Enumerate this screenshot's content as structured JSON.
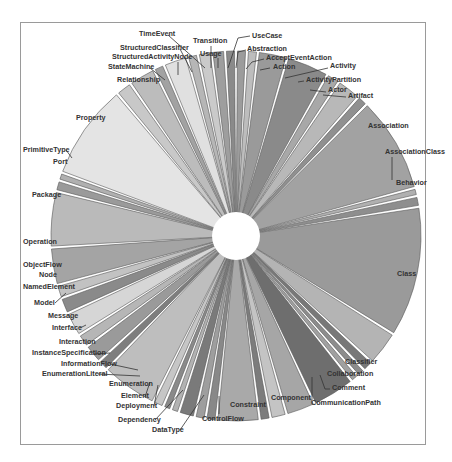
{
  "chart_data": {
    "type": "pie",
    "subtype": "exploded-pie",
    "title": "",
    "legend": "none (leader-line labels)",
    "start_angle_deg": 0,
    "direction": "clockwise",
    "center": [
      236,
      236
    ],
    "radius": 185,
    "inner_gap_radius": 22,
    "categories": [
      "Abstraction",
      "AcceptEventAction",
      "Action",
      "Activity",
      "ActivityPartition",
      "Actor",
      "Artifact",
      "Association",
      "AssociationClass",
      "Behavior",
      "Class",
      "Classifier",
      "Collaboration",
      "Comment",
      "CommunicationPath",
      "Component",
      "Constraint",
      "ControlFlow",
      "DataType",
      "Dependency",
      "Deployment",
      "Element",
      "Enumeration",
      "EnumerationLiteral",
      "InformationFlow",
      "InstanceSpecification",
      "Interaction",
      "Interface",
      "Message",
      "Model",
      "NamedElement",
      "Node",
      "ObjectFlow",
      "Operation",
      "Package",
      "Port",
      "PrimitiveType",
      "Property",
      "Relationship",
      "StateMachine",
      "StructuredActivityNode",
      "StructuredClassifier",
      "TimeEvent",
      "Transition",
      "Usage",
      "UseCase"
    ],
    "values": [
      3,
      3,
      10,
      15,
      4,
      8,
      3,
      35,
      2,
      3,
      48,
      12,
      3,
      2,
      2,
      15,
      10,
      5,
      3,
      15,
      3,
      3,
      5,
      2,
      2,
      3,
      20,
      3,
      6,
      4,
      8,
      5,
      4,
      13,
      20,
      3,
      2,
      35,
      5,
      9,
      3,
      8,
      3,
      4,
      4,
      3
    ],
    "shades": [
      "#9c9c9c",
      "#bdbdbd",
      "#9a9a9a",
      "#8a8a8a",
      "#a8a8a8",
      "#b8b8b8",
      "#909090",
      "#a2a2a2",
      "#b0b0b0",
      "#8e8e8e",
      "#9a9a9a",
      "#b4b4b4",
      "#787878",
      "#8c8c8c",
      "#a0a0a0",
      "#6e6e6e",
      "#a6a6a6",
      "#c4c4c4",
      "#7c7c7c",
      "#a9a9a9",
      "#888888",
      "#9e9e9e",
      "#7a7a7a",
      "#b2b2b2",
      "#8a8a8a",
      "#c6c6c6",
      "#bebebe",
      "#7e7e7e",
      "#9a9a9a",
      "#b6b6b6",
      "#d6d6d6",
      "#8a8a8a",
      "#c2c2c2",
      "#a4a4a4",
      "#bababa",
      "#9a9a9a",
      "#b0b0b0",
      "#e4e4e4",
      "#c8c8c8",
      "#bcbcbc",
      "#a2a2a2",
      "#e0e0e0",
      "#b6b6b6",
      "#cacaca",
      "#9e9e9e",
      "#8a8a8a"
    ],
    "labels": [
      {
        "text": "UseCase",
        "x": 252,
        "y": 38,
        "anchor": "start",
        "lx": [
          250,
          238,
          228
        ],
        "ly": [
          36,
          38,
          68
        ]
      },
      {
        "text": "Abstraction",
        "x": 247,
        "y": 51,
        "anchor": "start",
        "lx": [
          246,
          238,
          236
        ],
        "ly": [
          50,
          52,
          68
        ]
      },
      {
        "text": "AcceptEventAction",
        "x": 266,
        "y": 60,
        "anchor": "start",
        "lx": [
          264,
          252,
          246
        ],
        "ly": [
          59,
          62,
          69
        ]
      },
      {
        "text": "Action",
        "x": 273,
        "y": 69,
        "anchor": "start",
        "lx": [
          270,
          260
        ],
        "ly": [
          68,
          70
        ]
      },
      {
        "text": "Activity",
        "x": 330,
        "y": 68,
        "anchor": "start",
        "lx": [
          328,
          285
        ],
        "ly": [
          68,
          78
        ]
      },
      {
        "text": "ActivityPartition",
        "x": 306,
        "y": 82,
        "anchor": "start",
        "lx": [
          304,
          298
        ],
        "ly": [
          81,
          82
        ]
      },
      {
        "text": "Actor",
        "x": 328,
        "y": 92,
        "anchor": "start",
        "lx": [
          326,
          310
        ],
        "ly": [
          92,
          90
        ]
      },
      {
        "text": "Artifact",
        "x": 348,
        "y": 98,
        "anchor": "start",
        "lx": [
          346,
          323
        ],
        "ly": [
          97,
          95
        ]
      },
      {
        "text": "Association",
        "x": 368,
        "y": 128,
        "anchor": "start"
      },
      {
        "text": "AssociationClass",
        "x": 385,
        "y": 154,
        "anchor": "start",
        "lx": [
          392,
          392
        ],
        "ly": [
          157,
          180
        ]
      },
      {
        "text": "Behavior",
        "x": 396,
        "y": 185,
        "anchor": "start"
      },
      {
        "text": "Class",
        "x": 397,
        "y": 276,
        "anchor": "start"
      },
      {
        "text": "Classifier",
        "x": 345,
        "y": 364,
        "anchor": "start"
      },
      {
        "text": "Collaboration",
        "x": 327,
        "y": 376,
        "anchor": "start"
      },
      {
        "text": "Comment",
        "x": 332,
        "y": 390,
        "anchor": "start",
        "lx": [
          330,
          325,
          320
        ],
        "ly": [
          389,
          389,
          375
        ]
      },
      {
        "text": "CommunicationPath",
        "x": 311,
        "y": 405,
        "anchor": "start",
        "lx": [
          312,
          312
        ],
        "ly": [
          400,
          377
        ]
      },
      {
        "text": "Component",
        "x": 271,
        "y": 400,
        "anchor": "start"
      },
      {
        "text": "Constraint",
        "x": 230,
        "y": 407,
        "anchor": "start"
      },
      {
        "text": "ControlFlow",
        "x": 202,
        "y": 421,
        "anchor": "start",
        "lx": [
          219,
          219
        ],
        "ly": [
          414,
          396
        ]
      },
      {
        "text": "DataType",
        "x": 152,
        "y": 432,
        "anchor": "start",
        "lx": [
          180,
          204
        ],
        "ly": [
          430,
          395
        ]
      },
      {
        "text": "Dependency",
        "x": 118,
        "y": 422,
        "anchor": "start",
        "lx": [
          155,
          183
        ],
        "ly": [
          420,
          390
        ]
      },
      {
        "text": "Deployment",
        "x": 116,
        "y": 408,
        "anchor": "start",
        "lx": [
          154,
          158
        ],
        "ly": [
          406,
          385
        ]
      },
      {
        "text": "Element",
        "x": 121,
        "y": 398,
        "anchor": "start",
        "lx": [
          145,
          150
        ],
        "ly": [
          397,
          382
        ]
      },
      {
        "text": "Enumeration",
        "x": 109,
        "y": 386,
        "anchor": "start"
      },
      {
        "text": "EnumerationLiteral",
        "x": 42,
        "y": 376,
        "anchor": "start",
        "lx": [
          98,
          140
        ],
        "ly": [
          374,
          376
        ]
      },
      {
        "text": "InformationFlow",
        "x": 61,
        "y": 366,
        "anchor": "start",
        "lx": [
          110,
          138
        ],
        "ly": [
          364,
          370
        ]
      },
      {
        "text": "InstanceSpecification",
        "x": 32,
        "y": 355,
        "anchor": "start",
        "lx": [
          94,
          110
        ],
        "ly": [
          354,
          353
        ]
      },
      {
        "text": "Interaction",
        "x": 59,
        "y": 344,
        "anchor": "start"
      },
      {
        "text": "Interface",
        "x": 52,
        "y": 330,
        "anchor": "start",
        "lx": [
          80,
          86
        ],
        "ly": [
          328,
          325
        ]
      },
      {
        "text": "Message",
        "x": 48,
        "y": 318,
        "anchor": "start"
      },
      {
        "text": "Model",
        "x": 34,
        "y": 305,
        "anchor": "start",
        "lx": [
          55,
          66
        ],
        "ly": [
          303,
          293
        ]
      },
      {
        "text": "NamedElement",
        "x": 23,
        "y": 289,
        "anchor": "start"
      },
      {
        "text": "Node",
        "x": 39,
        "y": 277,
        "anchor": "start"
      },
      {
        "text": "ObjectFlow",
        "x": 23,
        "y": 267,
        "anchor": "start"
      },
      {
        "text": "Operation",
        "x": 23,
        "y": 244,
        "anchor": "start"
      },
      {
        "text": "Package",
        "x": 32,
        "y": 197,
        "anchor": "start"
      },
      {
        "text": "Port",
        "x": 53,
        "y": 164,
        "anchor": "start"
      },
      {
        "text": "PrimitiveType",
        "x": 23,
        "y": 152,
        "anchor": "start",
        "lx": [
          66,
          72
        ],
        "ly": [
          150,
          158
        ]
      },
      {
        "text": "Property",
        "x": 76,
        "y": 120,
        "anchor": "start"
      },
      {
        "text": "Relationship",
        "x": 117,
        "y": 82,
        "anchor": "start"
      },
      {
        "text": "StateMachine",
        "x": 108,
        "y": 69,
        "anchor": "start",
        "lx": [
          150,
          165
        ],
        "ly": [
          68,
          80
        ]
      },
      {
        "text": "StructuredActivityNode",
        "x": 112,
        "y": 59,
        "anchor": "start",
        "lx": [
          178,
          178
        ],
        "ly": [
          62,
          75
        ]
      },
      {
        "text": "StructuredClassifier",
        "x": 120,
        "y": 50,
        "anchor": "start",
        "lx": [
          180,
          192
        ],
        "ly": [
          49,
          72
        ]
      },
      {
        "text": "TimeEvent",
        "x": 139,
        "y": 36,
        "anchor": "start",
        "lx": [
          168,
          205
        ],
        "ly": [
          35,
          68
        ]
      },
      {
        "text": "Transition",
        "x": 193,
        "y": 43,
        "anchor": "start",
        "lx": [
          211,
          211
        ],
        "ly": [
          46,
          68
        ]
      },
      {
        "text": "Usage",
        "x": 200,
        "y": 56,
        "anchor": "start",
        "lx": [
          218,
          218
        ],
        "ly": [
          58,
          68
        ]
      }
    ]
  }
}
